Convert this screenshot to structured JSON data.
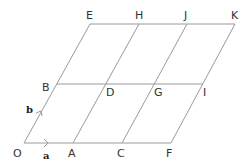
{
  "diagram": {
    "title": "",
    "line_color": "#9a9a9a",
    "points": [
      {
        "label": "O",
        "x": 24,
        "y": 143,
        "lx": 13,
        "ly": 157
      },
      {
        "label": "A",
        "x": 73,
        "y": 143,
        "lx": 68,
        "ly": 157
      },
      {
        "label": "C",
        "x": 122,
        "y": 143,
        "lx": 117,
        "ly": 157
      },
      {
        "label": "F",
        "x": 171,
        "y": 143,
        "lx": 166,
        "ly": 157
      },
      {
        "label": "B",
        "x": 57,
        "y": 84,
        "lx": 42,
        "ly": 91
      },
      {
        "label": "D",
        "x": 106,
        "y": 84,
        "lx": 106,
        "ly": 96
      },
      {
        "label": "G",
        "x": 154,
        "y": 84,
        "lx": 154,
        "ly": 96
      },
      {
        "label": "I",
        "x": 203,
        "y": 84,
        "lx": 203,
        "ly": 96
      },
      {
        "label": "E",
        "x": 90,
        "y": 24,
        "lx": 86,
        "ly": 19
      },
      {
        "label": "H",
        "x": 139,
        "y": 24,
        "lx": 135,
        "ly": 19
      },
      {
        "label": "J",
        "x": 187,
        "y": 24,
        "lx": 184,
        "ly": 19
      },
      {
        "label": "K",
        "x": 235,
        "y": 24,
        "lx": 231,
        "ly": 19
      }
    ],
    "vectors": [
      {
        "label": "a",
        "from": "O",
        "to": "A",
        "lx": 43,
        "ly": 159
      },
      {
        "label": "b",
        "from": "O",
        "to": "B",
        "lx": 25,
        "ly": 113
      }
    ]
  }
}
